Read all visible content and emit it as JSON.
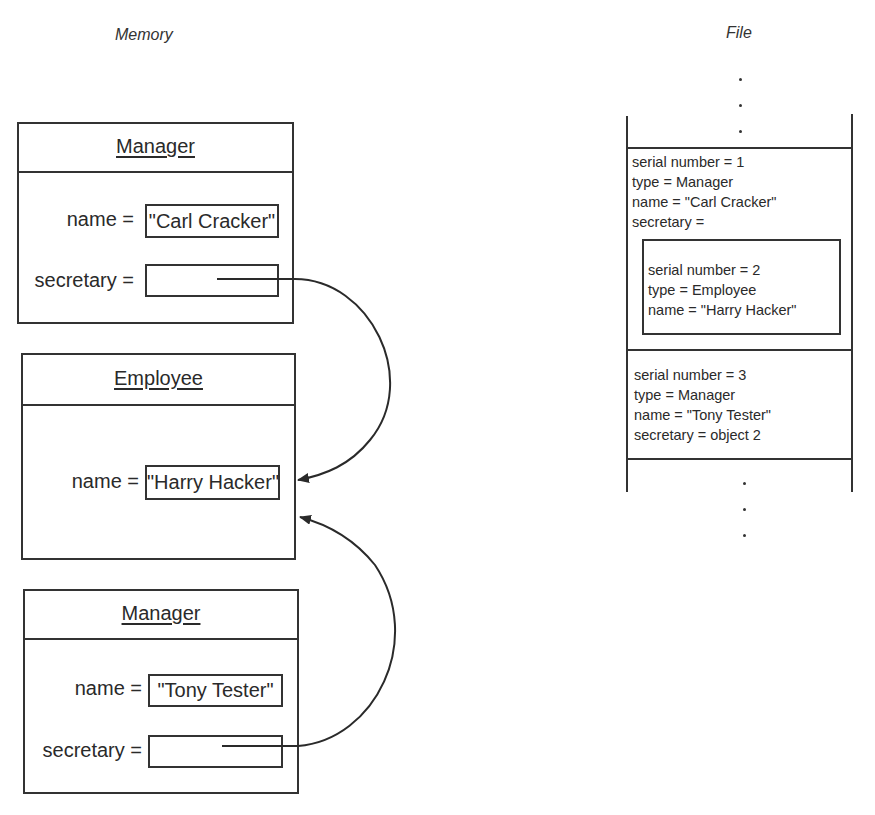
{
  "memory": {
    "title": "Memory",
    "objects": [
      {
        "class_name": "Manager",
        "fields": [
          {
            "label": "name =",
            "value": "\"Carl Cracker\""
          },
          {
            "label": "secretary =",
            "value": ""
          }
        ]
      },
      {
        "class_name": "Employee",
        "fields": [
          {
            "label": "name =",
            "value": "\"Harry Hacker\""
          }
        ]
      },
      {
        "class_name": "Manager",
        "fields": [
          {
            "label": "name =",
            "value": "\"Tony Tester\""
          },
          {
            "label": "secretary =",
            "value": ""
          }
        ]
      }
    ],
    "references": [
      {
        "from": "Manager \"Carl Cracker\" secretary",
        "to": "Employee \"Harry Hacker\""
      },
      {
        "from": "Manager \"Tony Tester\" secretary",
        "to": "Employee \"Harry Hacker\""
      }
    ]
  },
  "file": {
    "title": "File",
    "records": [
      {
        "lines": [
          "serial number = 1",
          "type = Manager",
          "name = \"Carl Cracker\"",
          "secretary ="
        ],
        "nested": {
          "lines": [
            "serial number = 2",
            "type = Employee",
            "name = \"Harry Hacker\""
          ]
        }
      },
      {
        "lines": [
          "serial number = 3",
          "type = Manager",
          "name = \"Tony Tester\"",
          "secretary = object 2"
        ]
      }
    ],
    "ellipsis_top": "⋮",
    "ellipsis_bottom": "⋮"
  }
}
